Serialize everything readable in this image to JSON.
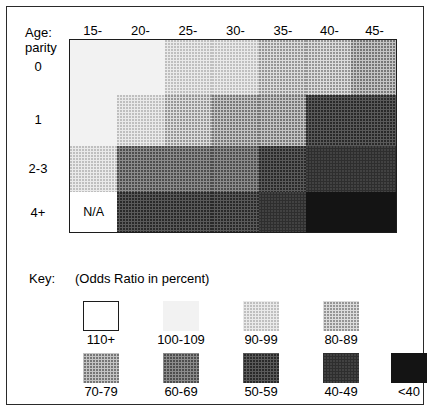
{
  "figure": {
    "row_axis_title_line1": "Age:",
    "row_axis_title_line2": "parity"
  },
  "chart_data": {
    "type": "heatmap",
    "title": "",
    "xlabel": "Age:",
    "ylabel": "parity",
    "value_unit": "Odds Ratio in percent",
    "categories": [
      "15-",
      "20-",
      "25-",
      "30-",
      "35-",
      "40-",
      "45-"
    ],
    "rows": [
      "0",
      "1",
      "2-3",
      "4+"
    ],
    "grid": false,
    "legend_position": "bottom",
    "shade_bins": [
      {
        "key": "110+",
        "class": "s110",
        "hex": "#ffffff"
      },
      {
        "key": "100-109",
        "class": "s100",
        "hex": "#f2f2f2"
      },
      {
        "key": "90-99",
        "class": "s90",
        "hex": "#eaeaea"
      },
      {
        "key": "80-89",
        "class": "s80",
        "hex": "#dcdcdc"
      },
      {
        "key": "70-79",
        "class": "s70",
        "hex": "#c4c4c4"
      },
      {
        "key": "60-69",
        "class": "s60",
        "hex": "#8c8c8c"
      },
      {
        "key": "50-59",
        "class": "s50",
        "hex": "#5a5a5a"
      },
      {
        "key": "40-49",
        "class": "s40",
        "hex": "#2e2e2e"
      },
      {
        "key": "<40",
        "class": "s00",
        "hex": "#141414"
      }
    ],
    "cells": [
      {
        "row": "0",
        "bins": [
          "100-109",
          "100-109",
          "90-99",
          "90-99",
          "80-89",
          "80-89",
          "70-79"
        ]
      },
      {
        "row": "1",
        "bins": [
          "100-109",
          "90-99",
          "80-89",
          "70-79",
          "70-79",
          "50-59",
          "50-59"
        ]
      },
      {
        "row": "2-3",
        "bins": [
          "90-99",
          "60-69",
          "60-69",
          "60-69",
          "50-59",
          "40-49",
          "40-49"
        ]
      },
      {
        "row": "4+",
        "bins": [
          "N/A",
          "50-59",
          "50-59",
          "50-59",
          "40-49",
          "<40",
          "<40"
        ]
      }
    ],
    "column_widths_pct": [
      14.5,
      14.5,
      14.5,
      14.5,
      14.5,
      13.8,
      13.7
    ],
    "row_heights_pct": [
      28.5,
      26.5,
      24.0,
      21.0
    ],
    "na_label": "N/A"
  },
  "legend": {
    "title": "Key:",
    "subtitle": "(Odds Ratio in percent)",
    "row1": [
      {
        "label": "110+",
        "class": "s110",
        "bordered": true
      },
      {
        "label": "100-109",
        "class": "s100",
        "bordered": false
      },
      {
        "label": "90-99",
        "class": "s90",
        "bordered": false
      },
      {
        "label": "80-89",
        "class": "s80",
        "bordered": false
      }
    ],
    "row2": [
      {
        "label": "70-79",
        "class": "s70",
        "bordered": false
      },
      {
        "label": "60-69",
        "class": "s60",
        "bordered": false
      },
      {
        "label": "50-59",
        "class": "s50",
        "bordered": false
      },
      {
        "label": "40-49",
        "class": "s40",
        "bordered": false
      },
      {
        "label": "<40",
        "class": "s00",
        "bordered": false
      }
    ]
  }
}
